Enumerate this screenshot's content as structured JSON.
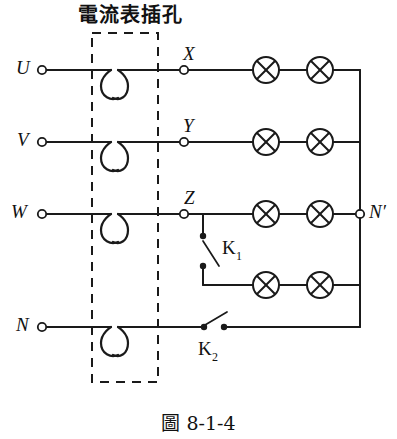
{
  "figure": {
    "annotation_title": "電流表插孔",
    "caption_prefix": "圖",
    "caption_number": "8-1-4",
    "caption_full": "圖 8-1-4"
  },
  "colors": {
    "background": "#ffffff",
    "line": "#1a1a1a",
    "text": "#111111"
  },
  "terminals": {
    "left": [
      {
        "id": "U",
        "label": "U",
        "y": 70
      },
      {
        "id": "V",
        "label": "V",
        "y": 142
      },
      {
        "id": "W",
        "label": "W",
        "y": 214
      },
      {
        "id": "N",
        "label": "N",
        "y": 327
      }
    ],
    "mid": [
      {
        "id": "X",
        "label": "X",
        "y": 70
      },
      {
        "id": "Y",
        "label": "Y",
        "y": 142
      },
      {
        "id": "Z",
        "label": "Z",
        "y": 214
      }
    ],
    "right": [
      {
        "id": "Nprime",
        "label": "N′",
        "y": 214
      }
    ]
  },
  "switches": [
    {
      "id": "K1",
      "label": "K",
      "subscript": "1",
      "orientation": "vertical",
      "state": "open"
    },
    {
      "id": "K2",
      "label": "K",
      "subscript": "2",
      "orientation": "horizontal",
      "state": "open"
    }
  ],
  "lamp_rows": [
    {
      "row": 1,
      "phase": "X",
      "y": 70,
      "count": 2
    },
    {
      "row": 2,
      "phase": "Y",
      "y": 142,
      "count": 2
    },
    {
      "row": 3,
      "phase": "Z",
      "y": 214,
      "count": 2
    },
    {
      "row": 4,
      "phase": "K1-branch",
      "y": 285,
      "count": 2
    }
  ],
  "jacks": {
    "name": "ammeter-jack",
    "count": 4,
    "rows": [
      70,
      142,
      214,
      327
    ]
  },
  "dashed_box": {
    "x": 92,
    "y": 33,
    "width": 66,
    "height": 349
  }
}
